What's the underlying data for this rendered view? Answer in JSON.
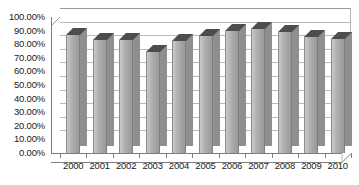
{
  "chart_data": {
    "type": "bar",
    "title": "",
    "subtitle": "",
    "xlabel": "",
    "ylabel": "",
    "categories": [
      "2000",
      "2001",
      "2002",
      "2003",
      "2004",
      "2005",
      "2006",
      "2007",
      "2008",
      "2009",
      "2010"
    ],
    "values": [
      87.0,
      83.0,
      83.0,
      74.0,
      82.0,
      86.0,
      90.0,
      91.0,
      89.0,
      85.0,
      84.0
    ],
    "series": [
      {
        "name": "",
        "values": [
          87.0,
          83.0,
          83.0,
          74.0,
          82.0,
          86.0,
          90.0,
          91.0,
          89.0,
          85.0,
          84.0
        ]
      }
    ],
    "ylim": [
      0,
      100
    ],
    "ytick_values": [
      0,
      10,
      20,
      30,
      40,
      50,
      60,
      70,
      80,
      90,
      100
    ],
    "ytick_labels": [
      "0.00%",
      "10.00%",
      "20.00%",
      "30.00%",
      "40.00%",
      "50.00%",
      "60.00%",
      "70.00%",
      "80.00%",
      "90.00%",
      "100.00%"
    ],
    "xtick_labels": [
      "2000",
      "2001",
      "2002",
      "2003",
      "2004",
      "2005",
      "2006",
      "2007",
      "2008",
      "2009",
      "2010"
    ],
    "grid": true,
    "grid_axis": "y",
    "legend": false,
    "legend_position": "none",
    "annotations": [],
    "style": "3d-column",
    "bar_color": "#a8a8a8",
    "bar_top_color": "#4d4d4d",
    "bar_side_color": "#8f8f8f",
    "grid_color": "#b9b9b9",
    "axis_color": "#7d7d7d",
    "text_color": "#1a1a1a",
    "background_color": "#ffffff"
  }
}
